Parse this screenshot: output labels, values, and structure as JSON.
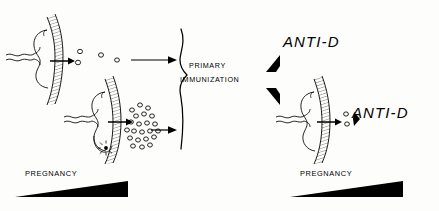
{
  "figure": {
    "background_color": "#fdfdfc",
    "ink_color": "#000000"
  },
  "labels": {
    "primary": "PRIMARY",
    "immunization": "IMMUNIZATION",
    "anti_d_top": "ANTI-D",
    "anti_d_bottom": "ANTI-D",
    "pregnancy_left": "PREGNANCY",
    "pregnancy_right": "PREGNANCY"
  },
  "panels": {
    "left": {
      "name": "first-pregnancy-panel",
      "placentas": [
        {
          "name": "placenta-first-pregnancy",
          "cells_crossing": 4,
          "description": "placenta with hatched membrane, umbilical cord, arrow with few fetal cells crossing"
        },
        {
          "name": "placenta-second-pregnancy",
          "cells_crossing": 22,
          "has_bleed_marker": true,
          "description": "placenta with hatched membrane, umbilical cord, starburst bleed marker, arrow with many fetal cells crossing"
        }
      ],
      "flow_arrows": 2,
      "timeline": {
        "name": "pregnancy-wedge-left",
        "label": "PREGNANCY",
        "direction": "increasing"
      }
    },
    "center": {
      "name": "primary-immunization-brace",
      "brace": "}",
      "text_lines": [
        "PRIMARY",
        "IMMUNIZATION"
      ]
    },
    "right": {
      "name": "anti-d-response-panel",
      "arrowheads": 2,
      "antibody_labels": [
        "ANTI-D",
        "ANTI-D"
      ],
      "placenta": {
        "name": "placenta-subsequent-pregnancy",
        "cells_crossing": 2,
        "description": "placenta with arrow, two cells and anti-D antibody arrowhead"
      },
      "timeline": {
        "name": "pregnancy-wedge-right",
        "label": "PREGNANCY",
        "direction": "increasing"
      }
    }
  }
}
